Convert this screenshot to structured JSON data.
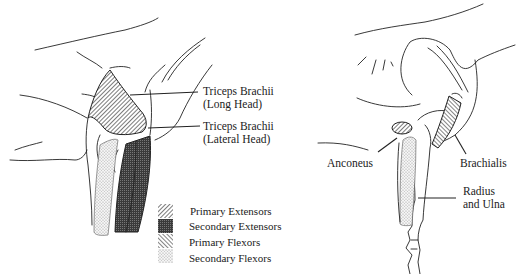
{
  "left_figure": {
    "labels": [
      {
        "id": "triceps-long",
        "lines": [
          "Triceps Brachii",
          "(Long Head)"
        ]
      },
      {
        "id": "triceps-lateral",
        "lines": [
          "Triceps Brachii",
          "(Lateral Head)"
        ]
      }
    ]
  },
  "right_figure": {
    "labels": [
      {
        "id": "anconeus",
        "lines": [
          "Anconeus"
        ]
      },
      {
        "id": "brachialis",
        "lines": [
          "Brachialis"
        ]
      },
      {
        "id": "radius-ulna",
        "lines": [
          "Radius",
          "and Ulna"
        ]
      }
    ]
  },
  "legend": {
    "items": [
      {
        "label": "Primary Extensors",
        "pattern": "diagonal-hatch-fine"
      },
      {
        "label": "Secondary Extensors",
        "pattern": "dark-crosshatch"
      },
      {
        "label": "Primary Flexors",
        "pattern": "diagonal-hatch"
      },
      {
        "label": "Secondary Flexors",
        "pattern": "light-stipple"
      }
    ]
  }
}
